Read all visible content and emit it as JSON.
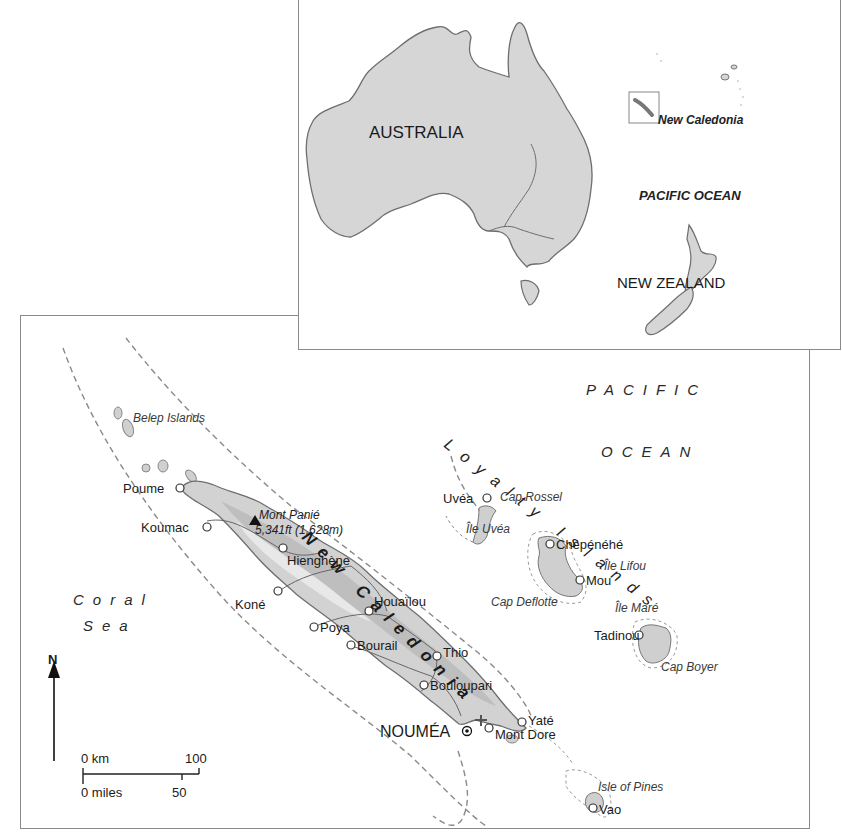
{
  "inset": {
    "labels": {
      "australia": "AUSTRALIA",
      "new_caledonia": "New Caledonia",
      "pacific_ocean": "PACIFIC OCEAN",
      "new_zealand": "NEW ZEALAND"
    }
  },
  "main": {
    "title_label": "New Caledonia",
    "seas": {
      "pacific_line1": "PACIFIC",
      "pacific_line2": "OCEAN",
      "coral_line1": "Coral",
      "coral_line2": "Sea"
    },
    "island_groups": {
      "loyalty_islands": "Loyalty Islands",
      "belep_islands": "Belep Islands",
      "isle_of_pines": "Isle of Pines"
    },
    "peak": {
      "name": "Mont Panié",
      "elevation": "5,341ft (1,628m)"
    },
    "capital": "NOUMÉA",
    "towns": [
      {
        "name": "Poume"
      },
      {
        "name": "Koumac"
      },
      {
        "name": "Hienghène"
      },
      {
        "name": "Koné"
      },
      {
        "name": "Houaïlou"
      },
      {
        "name": "Poya"
      },
      {
        "name": "Bourail"
      },
      {
        "name": "Thio"
      },
      {
        "name": "Bouloupari"
      },
      {
        "name": "Yaté"
      },
      {
        "name": "Mont Dore"
      },
      {
        "name": "Vao"
      },
      {
        "name": "Uvéa"
      },
      {
        "name": "Chépénéhé"
      },
      {
        "name": "Mou"
      },
      {
        "name": "Tadinou"
      }
    ],
    "features": {
      "cap_rossel": "Cap Rossel",
      "ile_uvea": "Île Uvéa",
      "ile_lifou": "Île Lifou",
      "cap_deflotte": "Cap Deflotte",
      "ile_mare": "Île Maré",
      "cap_boyer": "Cap Boyer"
    },
    "compass": {
      "north_label": "N"
    },
    "scale": {
      "km_start": "0 km",
      "km_end": "100",
      "miles_start": "0 miles",
      "miles_mid": "50"
    }
  },
  "colors": {
    "land": "#d4d4d4",
    "land_dark": "#b8b8b8",
    "outline": "#777777",
    "frame": "#8a8a8a",
    "water": "#ffffff"
  }
}
